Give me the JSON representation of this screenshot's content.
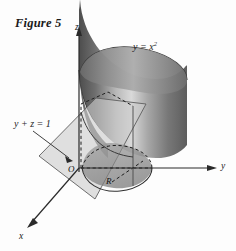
{
  "figure": {
    "title": "Figure 5",
    "background_color": "#fdfdfd",
    "ink_color": "#1a1a1a"
  },
  "axes": {
    "z_label": "z",
    "y_label": "y",
    "x_label": "x",
    "origin_label": "O"
  },
  "labels": {
    "surface_equation_lead": "y = x",
    "surface_equation_exponent": "2",
    "plane_equation": "y + z = 1",
    "region_label": "R"
  },
  "surfaces": {
    "cylinder_name": "parabolic-cylinder",
    "cylinder_shade_light": "#e8e8e8",
    "cylinder_shade_mid": "#9a9a9a",
    "cylinder_shade_dark": "#5a5a5a",
    "plane_name": "plane-y-plus-z-equals-1",
    "plane_fill": "#c9c9c9",
    "plane_opacity": "0.62",
    "region_fill": "#8e8e8e"
  }
}
